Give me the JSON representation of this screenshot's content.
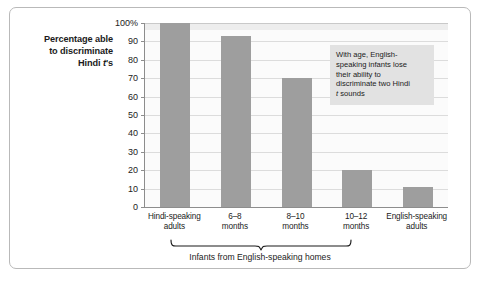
{
  "chart_data": {
    "type": "bar",
    "title": "",
    "subtitle": "",
    "xlabel": "Infants from English-speaking homes",
    "ylabel": "Percentage able to discriminate Hindi t's",
    "ylim": [
      0,
      100
    ],
    "grid": true,
    "legend": "none",
    "categories": [
      "Hindi-speaking adults",
      "6–8 months",
      "8–10 months",
      "10–12 months",
      "English-speaking adults"
    ],
    "values": [
      100,
      93,
      70,
      20,
      11
    ],
    "ytick_labels": [
      "100%",
      "90",
      "80",
      "70",
      "60",
      "50",
      "40",
      "30",
      "20",
      "10",
      "0"
    ],
    "ytick_values": [
      100,
      90,
      80,
      70,
      60,
      50,
      40,
      30,
      20,
      10,
      0
    ],
    "annotations": [
      {
        "text": "With age, English-speaking infants lose their ability to discriminate two Hindi t sounds",
        "target": "10–12 months"
      }
    ],
    "bar_color": "#9e9e9e",
    "plot_background": "#fbfbfb",
    "gridline_color": "#dcdcdc",
    "axis_color": "#8d8d8d",
    "annotation_background": "#e2e2e2",
    "frame_color": "#b9b9b9"
  },
  "axis": {
    "y_title_line1": "Percentage able",
    "y_title_line2": "to discriminate",
    "y_title_line3_pre": "Hindi ",
    "y_title_line3_ital": "t",
    "y_title_line3_post": "'s"
  },
  "annotation": {
    "line1": "With age, English-",
    "line2": "speaking infants lose",
    "line3": "their ability to",
    "line4": "discriminate two Hindi",
    "line5_ital": "t",
    "line5_post": " sounds"
  },
  "xaxis": {
    "labels": [
      {
        "line1": "Hindi-speaking",
        "line2": "adults"
      },
      {
        "line1": "6–8",
        "line2": "months"
      },
      {
        "line1": "8–10",
        "line2": "months"
      },
      {
        "line1": "10–12",
        "line2": "months"
      },
      {
        "line1": "English-speaking",
        "line2": "adults"
      }
    ],
    "brace_caption": "Infants from English-speaking homes"
  }
}
